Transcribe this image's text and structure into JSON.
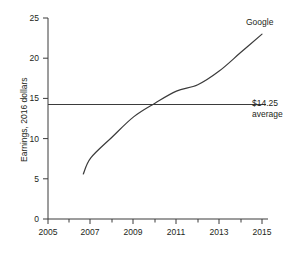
{
  "chart_data": {
    "type": "line",
    "title": "",
    "xlabel": "",
    "ylabel": "Earnings, 2016 dollars",
    "xlim": [
      2005,
      2015
    ],
    "ylim": [
      0,
      25
    ],
    "grid": false,
    "legend_position": "inline-right",
    "x_ticks": [
      "2005",
      "2007",
      "2009",
      "2011",
      "2013",
      "2015"
    ],
    "x_tick_values": [
      2005,
      2007,
      2009,
      2011,
      2013,
      2015
    ],
    "x_minor_tick_values": [
      2006,
      2008,
      2010,
      2012,
      2014
    ],
    "y_ticks": [
      "0",
      "5",
      "10",
      "15",
      "20",
      "25"
    ],
    "y_tick_values": [
      0,
      5,
      10,
      15,
      20,
      25
    ],
    "series": [
      {
        "name": "Google",
        "label": "Google",
        "color": "#3b3b3b",
        "x": [
          2006.65,
          2007,
          2008,
          2009,
          2010,
          2011,
          2012,
          2013,
          2014,
          2015
        ],
        "values": [
          5.6,
          7.6,
          10.2,
          12.7,
          14.4,
          15.9,
          16.7,
          18.4,
          20.7,
          23.0
        ]
      }
    ],
    "reference_lines": [
      {
        "name": "average",
        "orientation": "horizontal",
        "value": 14.25,
        "label_value": "$14.25",
        "label_caption": "average",
        "color": "#3b3b3b"
      }
    ]
  },
  "annotations": {
    "series_label": "Google",
    "average_value": "$14.25",
    "average_caption": "average"
  },
  "axis": {
    "y_title": "Earnings, 2016 dollars"
  },
  "colors": {
    "line": "#3b3b3b",
    "axis": "#3b3b3b",
    "background": "#ffffff",
    "text": "#231f20"
  }
}
